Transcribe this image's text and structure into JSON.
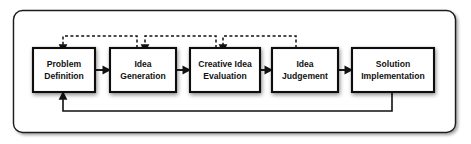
{
  "diagram": {
    "frame": {
      "x": 13,
      "y": 10,
      "width": 443,
      "height": 123,
      "radius": 9,
      "border_color": "#1a1a1a",
      "background_color": "#ffffff"
    },
    "geometry": {
      "box_top": 48,
      "box_height": 44,
      "box_border_color": "#111111",
      "box_fill": "#ffffff",
      "text_color": "#111111",
      "connector_color": "#111111"
    },
    "stages": [
      {
        "id": "problem-definition",
        "line1": "Problem",
        "line2": "Definition",
        "x": 33,
        "width": 62
      },
      {
        "id": "idea-generation",
        "line1": "Idea",
        "line2": "Generation",
        "x": 110,
        "width": 66
      },
      {
        "id": "creative-idea-evaluation",
        "line1": "Creative Idea",
        "line2": "Evaluation",
        "x": 190,
        "width": 70
      },
      {
        "id": "idea-judgement",
        "line1": "Idea",
        "line2": "Judgement",
        "x": 272,
        "width": 66
      },
      {
        "id": "solution-implementation",
        "line1": "Solution",
        "line2": "Implementation",
        "x": 352,
        "width": 82
      }
    ],
    "forward_arrows": [
      {
        "id": "arrow-problem-to-idea",
        "from": "problem-definition",
        "to": "idea-generation",
        "x1": 95,
        "x2": 110,
        "y": 70
      },
      {
        "id": "arrow-idea-to-evaluation",
        "from": "idea-generation",
        "to": "creative-idea-evaluation",
        "x1": 176,
        "x2": 190,
        "y": 70
      },
      {
        "id": "arrow-evaluation-to-judgement",
        "from": "creative-idea-evaluation",
        "to": "idea-judgement",
        "x1": 260,
        "x2": 272,
        "y": 70
      },
      {
        "id": "arrow-judgement-to-solution",
        "from": "idea-judgement",
        "to": "solution-implementation",
        "x1": 338,
        "x2": 352,
        "y": 70
      }
    ],
    "feedback_loops": [
      {
        "id": "feedback-idea-generation-to-problem-definition",
        "from": "idea-generation",
        "to": "problem-definition",
        "source_x": 137,
        "target_x": 63,
        "top_y": 36,
        "style": "dashed"
      },
      {
        "id": "feedback-creative-idea-evaluation-to-idea-generation",
        "from": "creative-idea-evaluation",
        "to": "idea-generation",
        "source_x": 216,
        "target_x": 145,
        "top_y": 36,
        "style": "dashed"
      },
      {
        "id": "feedback-idea-judgement-to-creative-idea-evaluation",
        "from": "idea-judgement",
        "to": "creative-idea-evaluation",
        "source_x": 296,
        "target_x": 223,
        "top_y": 36,
        "style": "dashed"
      }
    ],
    "return_loop": {
      "id": "return-solution-implementation-to-problem-definition",
      "from": "solution-implementation",
      "to": "problem-definition",
      "source_x": 392,
      "target_x": 63,
      "bottom_y": 111,
      "style": "solid"
    }
  }
}
